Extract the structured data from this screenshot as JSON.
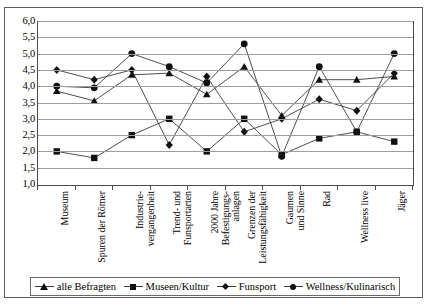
{
  "chart_data": {
    "type": "line",
    "title": "",
    "xlabel": "",
    "ylabel": "",
    "ylim": [
      1.0,
      6.0
    ],
    "grid": true,
    "legend_position": "bottom",
    "ytick_labels": [
      "6,0",
      "5,5",
      "5,0",
      "4,5",
      "4,0",
      "3,5",
      "3,0",
      "2,5",
      "2,0",
      "1,5",
      "1,0"
    ],
    "ytick_values": [
      6.0,
      5.5,
      5.0,
      4.5,
      4.0,
      3.5,
      3.0,
      2.5,
      2.0,
      1.5,
      1.0
    ],
    "categories": [
      "Museum",
      "Spuren der Römer",
      "Industrie-\nvergangenheit",
      "Trend- und\nFunsportarten",
      "2000 Jahre\nBefestigungs-\nanlagen",
      "Grenzen der\nLeistungsfähigkeit",
      "Gaumen\nund Sinne",
      "Rad",
      "Wellness live",
      "Jäger"
    ],
    "series": [
      {
        "name": "alle Befragten",
        "marker": "triangle",
        "values": [
          3.85,
          3.55,
          4.35,
          4.4,
          3.75,
          4.6,
          3.1,
          4.2,
          4.2,
          4.3
        ]
      },
      {
        "name": "Museen/Kultur",
        "marker": "square",
        "values": [
          2.0,
          1.8,
          2.5,
          3.0,
          2.0,
          3.0,
          1.9,
          2.4,
          2.6,
          2.3
        ]
      },
      {
        "name": "Funsport",
        "marker": "diamond",
        "values": [
          4.5,
          4.2,
          4.5,
          2.2,
          4.3,
          2.6,
          3.0,
          3.6,
          3.25,
          4.4
        ]
      },
      {
        "name": "Wellness/Kulinarisch",
        "marker": "circle",
        "values": [
          4.0,
          3.95,
          5.0,
          4.6,
          4.1,
          5.3,
          1.85,
          4.6,
          2.6,
          5.0
        ]
      }
    ]
  },
  "legend": {
    "items": [
      {
        "label": "alle Befragten",
        "marker": "triangle"
      },
      {
        "label": "Museen/Kultur",
        "marker": "square"
      },
      {
        "label": "Funsport",
        "marker": "diamond"
      },
      {
        "label": "Wellness/Kulinarisch",
        "marker": "circle"
      }
    ]
  },
  "colors": {
    "line": "#3a3a3a",
    "marker": "#111111",
    "grid": "#9d9d9d",
    "axis": "#4a4a4a",
    "border": "#5a5a5a"
  }
}
